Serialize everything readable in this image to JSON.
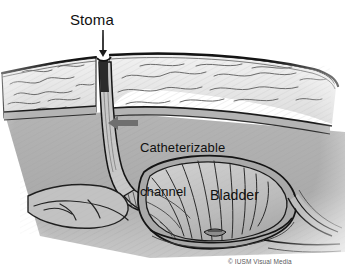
{
  "illustration": {
    "title": "Catheterizable channel (Mitrofanoff) to bladder — sagittal cross-section",
    "subject": "abdominal-wall-stoma-and-bladder"
  },
  "labels": {
    "stoma": "Stoma",
    "channel_line1": "Catheterizable",
    "channel_line2": "channel",
    "bladder": "Bladder"
  },
  "credit": {
    "text": "© IUSM Visual Media"
  },
  "annotations": {
    "stoma_leader": "vertical-leader-line",
    "channel_arrow": "left-pointing-arrow"
  },
  "colors": {
    "background": "#ffffff",
    "text": "#111111",
    "credit_text": "#5a5a5a",
    "outline": "#161616",
    "fat_layer": "#e9e9e9",
    "fascia_band": "#b9b9b9",
    "cavity": "#a9a9a9",
    "bladder_fill": "#bdbdbd",
    "bladder_wall": "#9a9a9a",
    "channel_fill": "#c6c6c6",
    "arrow": "#6f6f6f"
  }
}
